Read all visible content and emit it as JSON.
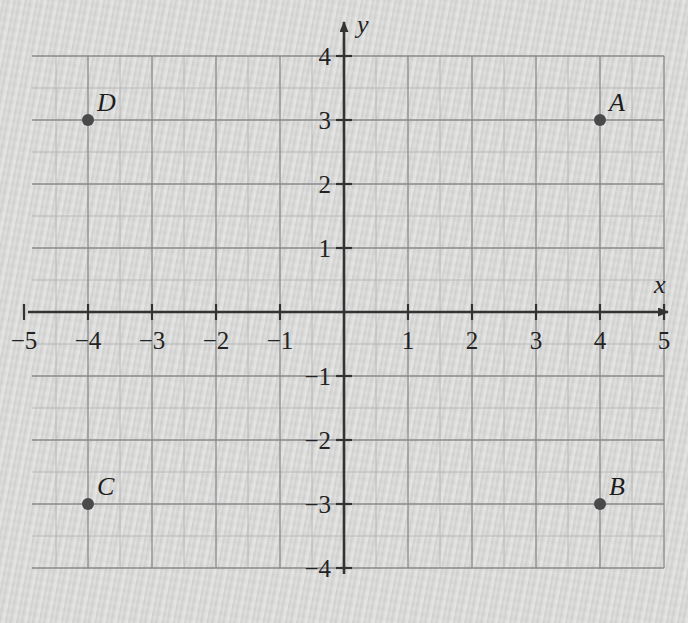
{
  "figure": {
    "kind": "cartesian-coordinate-plane",
    "background_color": "#d3d3d2",
    "axis_color": "#333333",
    "major_grid_color": "#8a8a8a",
    "minor_grid_color": "#b4b4b4",
    "point_color": "#4a4a4a"
  },
  "axes": {
    "x_label": "x",
    "y_label": "y",
    "x_min": -5,
    "x_max": 5,
    "y_min": -4,
    "y_max": 4,
    "unit_px": 64,
    "minor_per_unit": 2,
    "origin_px": {
      "x": 344,
      "y": 312
    },
    "x_arrow": true,
    "y_arrow": true
  },
  "ticks": {
    "x": [
      {
        "value": -5,
        "label": "−5"
      },
      {
        "value": -4,
        "label": "−4"
      },
      {
        "value": -3,
        "label": "−3"
      },
      {
        "value": -2,
        "label": "−2"
      },
      {
        "value": -1,
        "label": "−1"
      },
      {
        "value": 1,
        "label": "1"
      },
      {
        "value": 2,
        "label": "2"
      },
      {
        "value": 3,
        "label": "3"
      },
      {
        "value": 4,
        "label": "4"
      },
      {
        "value": 5,
        "label": "5"
      }
    ],
    "y": [
      {
        "value": 4,
        "label": "4"
      },
      {
        "value": 3,
        "label": "3"
      },
      {
        "value": 2,
        "label": "2"
      },
      {
        "value": 1,
        "label": "1"
      },
      {
        "value": -1,
        "label": "−1"
      },
      {
        "value": -2,
        "label": "−2"
      },
      {
        "value": -3,
        "label": "−3"
      },
      {
        "value": -4,
        "label": "−4"
      }
    ]
  },
  "chart_data": {
    "type": "scatter",
    "title": "",
    "xlabel": "x",
    "ylabel": "y",
    "xlim": [
      -5,
      5
    ],
    "ylim": [
      -4,
      4
    ],
    "grid": true,
    "legend": "none",
    "points": [
      {
        "label": "A",
        "x": 4,
        "y": 3
      },
      {
        "label": "B",
        "x": 4,
        "y": -3
      },
      {
        "label": "C",
        "x": -4,
        "y": -3
      },
      {
        "label": "D",
        "x": -4,
        "y": 3
      }
    ]
  },
  "top_bleed": {
    "text": "· · ·"
  }
}
